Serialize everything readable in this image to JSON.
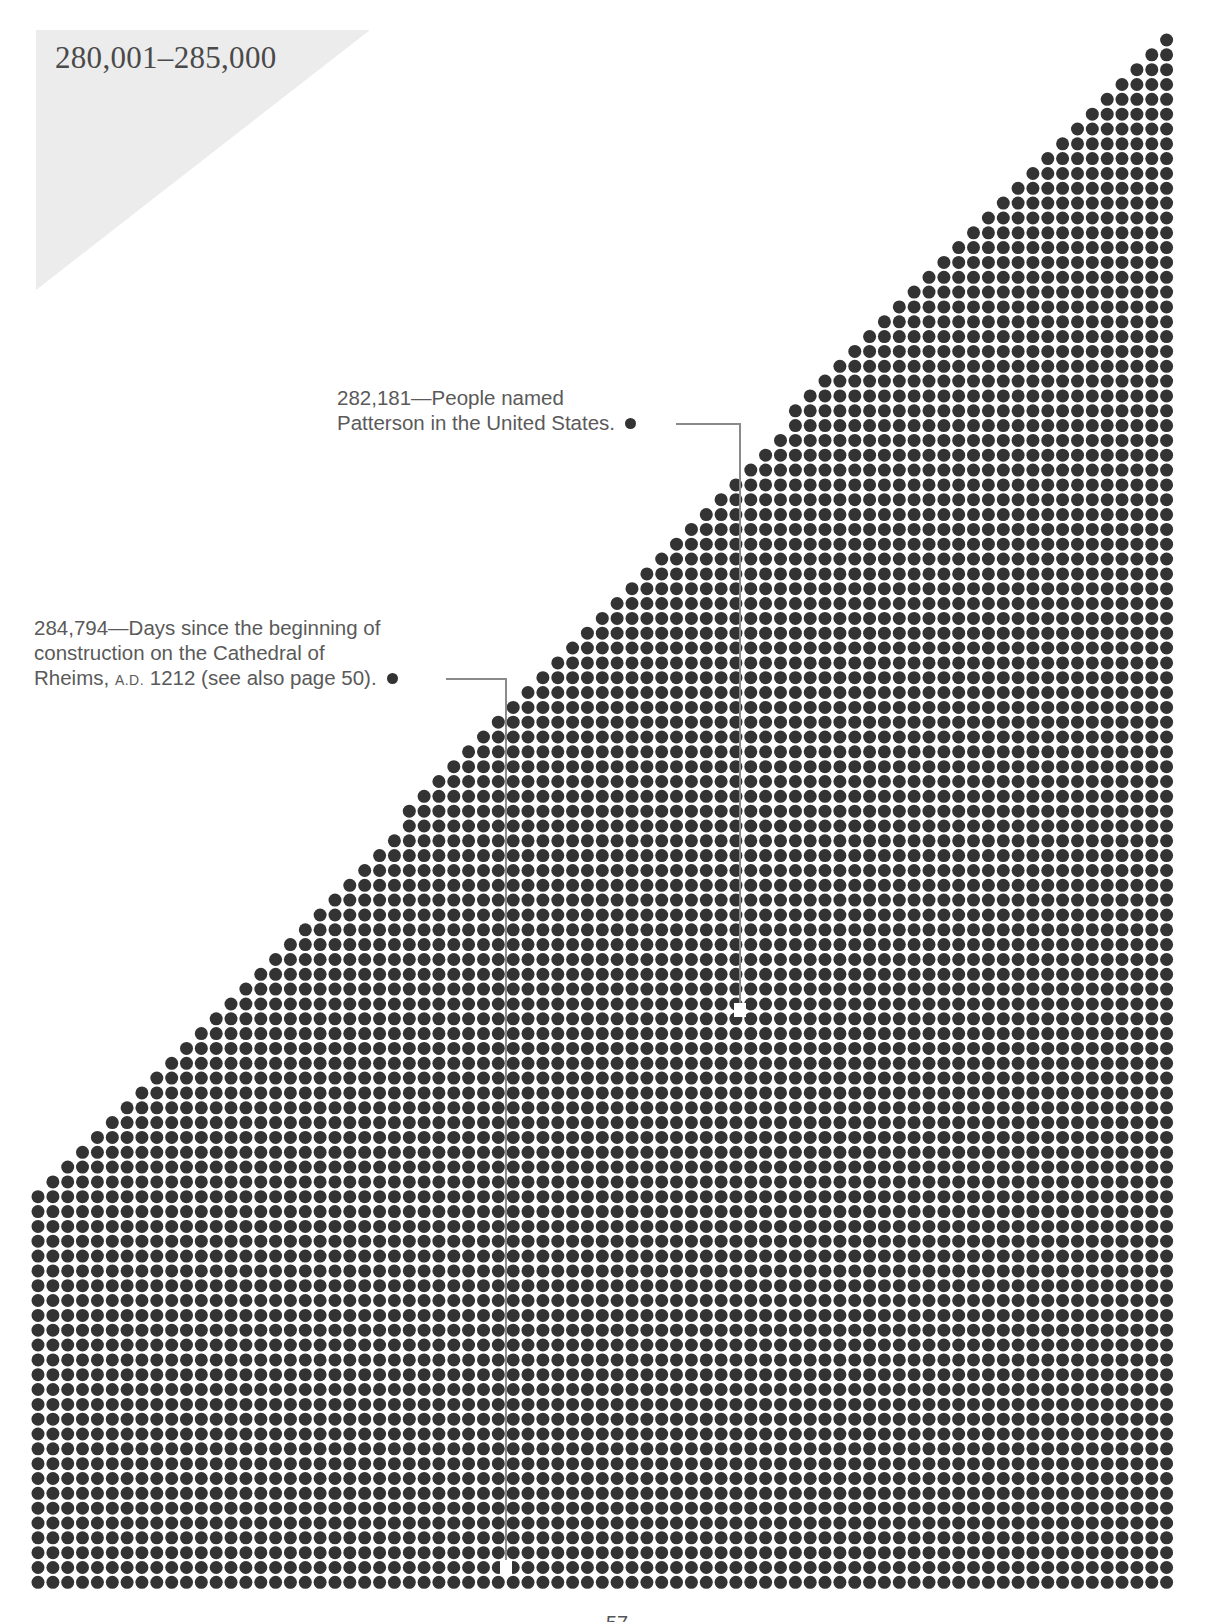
{
  "title": "280,001–285,000",
  "chart_data": {
    "type": "dot-grid",
    "title": "280,001–285,000",
    "range_start": 280001,
    "range_end": 285000,
    "total_dots": 5000,
    "grid": {
      "columns": 77,
      "rows": 105,
      "left_x": 38,
      "top_y": 40,
      "pitch_x": 14.85,
      "pitch_y": 14.83,
      "dot_diameter": 13,
      "staircase_rows": 80,
      "dot_color": "#333333"
    },
    "annotations": [
      {
        "value": 282181,
        "label": "282,181",
        "text": "People named Patterson in the United States.",
        "highlight_dot": {
          "x": 740,
          "y": 1010
        }
      },
      {
        "value": 284794,
        "label": "284,794",
        "text": "Days since the beginning of construction on the Cathedral of Rheims, A.D. 1212 (see also page 50).",
        "highlight_dot": {
          "x": 521,
          "y": 1567
        }
      }
    ]
  },
  "annotations": {
    "patterson": {
      "line1_num": "282,181",
      "line1_dash": "—",
      "line1_rest": "People named",
      "line2": "Patterson in the United States."
    },
    "rheims": {
      "line1_num": "284,794",
      "line1_dash": "—",
      "line1_rest": "Days since the beginning of",
      "line2": "construction on the Cathedral of",
      "line3_a": "Rheims, ",
      "line3_sc": "A.D.",
      "line3_b": " 1212 (see also page 50)."
    }
  },
  "page_number": "57",
  "colors": {
    "title_triangle": "#ececec",
    "dot": "#333333",
    "leader_line": "#8a8a8a",
    "text": "#5a5a5a"
  }
}
